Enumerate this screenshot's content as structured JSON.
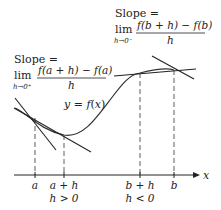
{
  "diagram": {
    "left_label": {
      "slope_prefix": "Slope =",
      "lim": "lim",
      "lim_sub": "h→0⁺",
      "numerator": "f(a + h) − f(a)",
      "denominator": "h"
    },
    "right_label": {
      "slope_prefix": "Slope =",
      "lim": "lim",
      "lim_sub": "h→0⁻",
      "numerator": "f(b + h) − f(b)",
      "denominator": "h"
    },
    "curve_label": "y = f(x)",
    "x_axis_label": "x",
    "ticks": [
      {
        "label": "a",
        "x": 35
      },
      {
        "label": "a + h",
        "x": 64
      },
      {
        "label": "b + h",
        "x": 140
      },
      {
        "label": "b",
        "x": 174
      }
    ],
    "conditions": [
      {
        "label": "h > 0",
        "x": 64
      },
      {
        "label": "h < 0",
        "x": 140
      }
    ],
    "colors": {
      "line": "#222222",
      "curve": "#333333",
      "text": "#222222"
    }
  }
}
